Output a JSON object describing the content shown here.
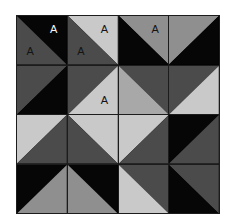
{
  "canvas": {
    "width": 232,
    "height": 222,
    "background_color": "#ffffff"
  },
  "grid": {
    "rows": 4,
    "columns": 4,
    "origin_x": 16,
    "origin_y": 15,
    "width": 204,
    "height": 199,
    "line_color": "#1c1c1c"
  },
  "palette": {
    "black": "#060606",
    "dark_gray": "#4b4b4b",
    "medium_gray": "#8f8f8f",
    "light_gray": "#c9c9c9",
    "label_dark": "#141414",
    "label_light": "#f4f4f4"
  },
  "labels": {
    "glyph": "A",
    "count": 6
  },
  "cells": [
    {
      "row": 0,
      "col": 0,
      "diagonal": "main",
      "first_color": "#060606",
      "second_color": "#4b4b4b",
      "labels": [
        {
          "text": "A",
          "position": "lbl-ur",
          "color": "#f4f4f4"
        },
        {
          "text": "A",
          "position": "lbl-ll",
          "color": "#141414"
        }
      ]
    },
    {
      "row": 0,
      "col": 1,
      "diagonal": "main",
      "first_color": "#c9c9c9",
      "second_color": "#4b4b4b",
      "labels": [
        {
          "text": "A",
          "position": "lbl-ur",
          "color": "#141414"
        },
        {
          "text": "A",
          "position": "lbl-ll",
          "color": "#141414"
        }
      ]
    },
    {
      "row": 0,
      "col": 2,
      "diagonal": "main",
      "first_color": "#8f8f8f",
      "second_color": "#060606",
      "labels": [
        {
          "text": "A",
          "position": "lbl-ur",
          "color": "#141414"
        }
      ]
    },
    {
      "row": 0,
      "col": 3,
      "diagonal": "anti",
      "first_color": "#8f8f8f",
      "second_color": "#060606",
      "labels": []
    },
    {
      "row": 1,
      "col": 0,
      "diagonal": "anti",
      "first_color": "#4b4b4b",
      "second_color": "#060606",
      "labels": []
    },
    {
      "row": 1,
      "col": 1,
      "diagonal": "anti",
      "first_color": "#4b4b4b",
      "second_color": "#c9c9c9",
      "labels": [
        {
          "text": "A",
          "position": "lbl-lr",
          "color": "#141414"
        }
      ]
    },
    {
      "row": 1,
      "col": 2,
      "diagonal": "main",
      "first_color": "#4b4b4b",
      "second_color": "#a8a8a8",
      "labels": []
    },
    {
      "row": 1,
      "col": 3,
      "diagonal": "anti",
      "first_color": "#4b4b4b",
      "second_color": "#c9c9c9",
      "labels": []
    },
    {
      "row": 2,
      "col": 0,
      "diagonal": "anti",
      "first_color": "#c9c9c9",
      "second_color": "#4b4b4b",
      "labels": []
    },
    {
      "row": 2,
      "col": 1,
      "diagonal": "main",
      "first_color": "#c9c9c9",
      "second_color": "#4b4b4b",
      "labels": []
    },
    {
      "row": 2,
      "col": 2,
      "diagonal": "anti",
      "first_color": "#c9c9c9",
      "second_color": "#4b4b4b",
      "labels": []
    },
    {
      "row": 2,
      "col": 3,
      "diagonal": "anti",
      "first_color": "#060606",
      "second_color": "#4b4b4b",
      "labels": []
    },
    {
      "row": 3,
      "col": 0,
      "diagonal": "anti",
      "first_color": "#060606",
      "second_color": "#8f8f8f",
      "labels": []
    },
    {
      "row": 3,
      "col": 1,
      "diagonal": "main",
      "first_color": "#060606",
      "second_color": "#8f8f8f",
      "labels": []
    },
    {
      "row": 3,
      "col": 2,
      "diagonal": "main",
      "first_color": "#4b4b4b",
      "second_color": "#c9c9c9",
      "labels": []
    },
    {
      "row": 3,
      "col": 3,
      "diagonal": "main",
      "first_color": "#4b4b4b",
      "second_color": "#060606",
      "labels": []
    }
  ]
}
